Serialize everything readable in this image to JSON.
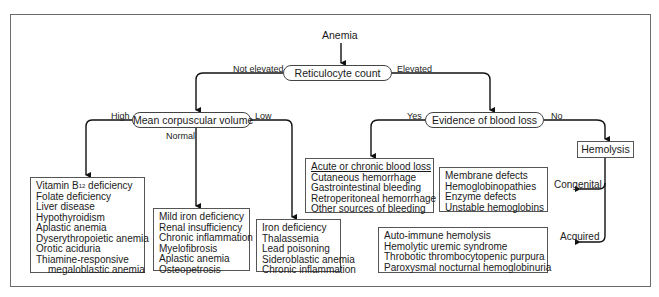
{
  "root": {
    "label": "Anemia"
  },
  "reticulocyte": {
    "label": "Reticulocyte count",
    "branch_left": "Not elevated",
    "branch_right": "Elevated"
  },
  "mcv": {
    "label": "Mean corpuscular volume",
    "branch_high": "High",
    "branch_normal": "Normal",
    "branch_low": "Low"
  },
  "blood_loss_question": {
    "label": "Evidence of blood loss",
    "branch_yes": "Yes",
    "branch_no": "No"
  },
  "hemolysis": {
    "label": "Hemolysis",
    "branch_congenital": "Congenital",
    "branch_acquired": "Acquired"
  },
  "boxes": {
    "high_mcv": {
      "items": [
        "Vitamin B",
        "Folate deficiency",
        "Liver disease",
        "Hypothyroidism",
        "Aplastic anemia",
        "Dyserythropoietic anemia",
        "Orotic aciduria",
        "Thiamine-responsive",
        "megaloblastic anemia"
      ],
      "b12_subscript": "12",
      "b12_suffix": " deficiency"
    },
    "normal_mcv": {
      "items": [
        "Mild iron deficiency",
        "Renal insufficiency",
        "Chronic inflammation",
        "Myelofibrosis",
        "Aplastic anemia",
        "Osteopetrosis"
      ]
    },
    "low_mcv": {
      "items": [
        "Iron deficiency",
        "Thalassemia",
        "Lead poisoning",
        "Sideroblastic anemia",
        "Chronic inflammation"
      ]
    },
    "blood_loss": {
      "header": "Acute or chronic blood loss",
      "items": [
        "Cutaneous hemorrhage",
        "Gastrointestinal bleeding",
        "Retroperitoneal hemorrhage",
        "Other sources of bleeding"
      ]
    },
    "congenital": {
      "items": [
        "Membrane defects",
        "Hemoglobinopathies",
        "Enzyme defects",
        "Unstable hemoglobins"
      ]
    },
    "acquired": {
      "items": [
        "Auto-immune hemolysis",
        "Hemolytic uremic syndrome",
        "Throbotic thrombocytopenic purpura",
        "Paroxysmal nocturnal hemoglobinuria"
      ]
    }
  },
  "colors": {
    "line": "#111111",
    "border": "#555555",
    "frame": "#6b6b6b"
  }
}
